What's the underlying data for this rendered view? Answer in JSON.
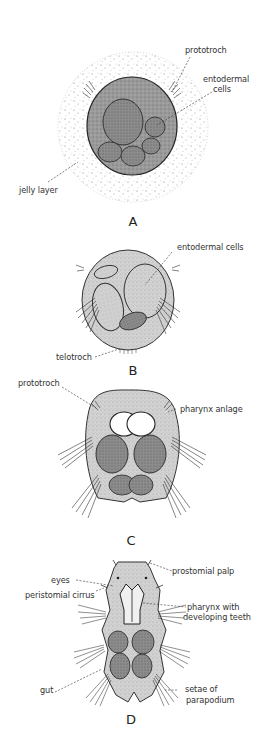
{
  "figure": {
    "panels": [
      {
        "id": "A",
        "letter": "A",
        "labels": {
          "prototroch": "prototroch",
          "entodermal_cells": "entodermal\ncells",
          "entodermal_line1": "entodermal",
          "entodermal_line2": "cells",
          "jelly_layer": "jelly layer"
        }
      },
      {
        "id": "B",
        "letter": "B",
        "labels": {
          "entodermal_cells": "entodermal cells",
          "telotroch": "telotroch"
        }
      },
      {
        "id": "C",
        "letter": "C",
        "labels": {
          "prototroch": "prototroch",
          "pharynx_anlage": "pharynx anlage"
        }
      },
      {
        "id": "D",
        "letter": "D",
        "labels": {
          "prostomial_palp": "prostomial palp",
          "eyes": "eyes",
          "peristomial_cirrus": "peristomial cirrus",
          "pharynx_line1": "pharynx with",
          "pharynx_line2": "developing teeth",
          "gut": "gut",
          "setae_line1": "setae of",
          "setae_line2": "parapodium"
        }
      }
    ],
    "colors": {
      "ink": "#2a2a2a",
      "body_fill": "#8a8a8a",
      "cell_fill": "#6e6e6e",
      "light_fill": "#c8c8c8",
      "jelly_dots": "#777777"
    }
  }
}
